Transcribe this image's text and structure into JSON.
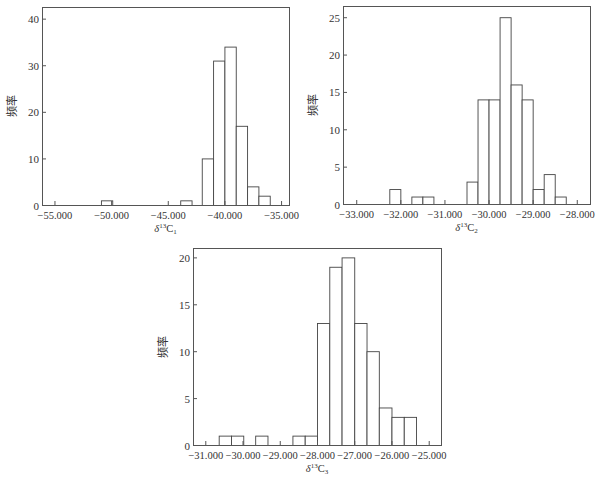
{
  "chart_data": [
    {
      "type": "bar",
      "id": "c1",
      "title": "",
      "xlabel": "δ13C1",
      "xlabel_parts": {
        "delta": "δ",
        "sup": "13",
        "base": "C",
        "sub": "1"
      },
      "ylabel": "频率",
      "xlim": [
        -56100,
        -34300
      ],
      "ylim": [
        0,
        42.5
      ],
      "xticks": [
        -55000,
        -50000,
        -45000,
        -40000,
        -35000
      ],
      "xtick_labels": [
        "-55.000",
        "-50.000",
        "-45.000",
        "-40.000",
        "-35.000"
      ],
      "yticks": [
        0,
        10,
        20,
        30,
        40
      ],
      "ytick_labels": [
        "0",
        "10",
        "20",
        "30",
        "40"
      ],
      "bin_width": 1000,
      "bins": [
        {
          "x0": -50900,
          "x1": -49900,
          "count": 1
        },
        {
          "x0": -43900,
          "x1": -42900,
          "count": 1
        },
        {
          "x0": -42000,
          "x1": -41000,
          "count": 10
        },
        {
          "x0": -41000,
          "x1": -40000,
          "count": 31
        },
        {
          "x0": -40000,
          "x1": -39000,
          "count": 34
        },
        {
          "x0": -39000,
          "x1": -38000,
          "count": 17
        },
        {
          "x0": -38000,
          "x1": -37000,
          "count": 4
        },
        {
          "x0": -37000,
          "x1": -36000,
          "count": 2
        }
      ],
      "grid": false,
      "box": {
        "left": 42,
        "top": 7,
        "right": 289,
        "bottom": 205
      }
    },
    {
      "type": "bar",
      "id": "c2",
      "title": "",
      "xlabel": "δ13C2",
      "xlabel_parts": {
        "delta": "δ",
        "sup": "13",
        "base": "C",
        "sub": "2"
      },
      "ylabel": "频率",
      "xlim": [
        -33300,
        -27700
      ],
      "ylim": [
        0,
        26.5
      ],
      "xticks": [
        -33000,
        -32000,
        -31000,
        -30000,
        -29000,
        -28000
      ],
      "xtick_labels": [
        "-33.000",
        "-32.000",
        "-31.000",
        "-30.000",
        "-29.000",
        "-28.000"
      ],
      "yticks": [
        0,
        5,
        10,
        15,
        20,
        25
      ],
      "ytick_labels": [
        "0",
        "5",
        "10",
        "15",
        "20",
        "25"
      ],
      "bin_width": 250,
      "bins": [
        {
          "x0": -32250,
          "x1": -32000,
          "count": 2
        },
        {
          "x0": -31750,
          "x1": -31500,
          "count": 1
        },
        {
          "x0": -31500,
          "x1": -31250,
          "count": 1
        },
        {
          "x0": -30500,
          "x1": -30250,
          "count": 3
        },
        {
          "x0": -30250,
          "x1": -30000,
          "count": 14
        },
        {
          "x0": -30000,
          "x1": -29750,
          "count": 14
        },
        {
          "x0": -29750,
          "x1": -29500,
          "count": 25
        },
        {
          "x0": -29500,
          "x1": -29250,
          "count": 16
        },
        {
          "x0": -29250,
          "x1": -29000,
          "count": 14
        },
        {
          "x0": -29000,
          "x1": -28750,
          "count": 2
        },
        {
          "x0": -28750,
          "x1": -28500,
          "count": 4
        },
        {
          "x0": -28500,
          "x1": -28250,
          "count": 1
        }
      ],
      "grid": false,
      "box": {
        "left": 343,
        "top": 6,
        "right": 590,
        "bottom": 204
      }
    },
    {
      "type": "bar",
      "id": "c3",
      "title": "",
      "xlabel": "δ13C3",
      "xlabel_parts": {
        "delta": "δ",
        "sup": "13",
        "base": "C",
        "sub": "3"
      },
      "ylabel": "频率",
      "xlim": [
        -31330,
        -24670
      ],
      "ylim": [
        0,
        21
      ],
      "xticks": [
        -31000,
        -30000,
        -29000,
        -28000,
        -27000,
        -26000,
        -25000
      ],
      "xtick_labels": [
        "-31.000",
        "-30.000",
        "-29.000",
        "-28.000",
        "-27.000",
        "-26.000",
        "-25.000"
      ],
      "yticks": [
        0,
        5,
        10,
        15,
        20
      ],
      "ytick_labels": [
        "0",
        "5",
        "10",
        "15",
        "20"
      ],
      "bin_width": 330,
      "bins": [
        {
          "x0": -30640,
          "x1": -30310,
          "count": 1
        },
        {
          "x0": -30310,
          "x1": -29980,
          "count": 1
        },
        {
          "x0": -29660,
          "x1": -29330,
          "count": 1
        },
        {
          "x0": -28660,
          "x1": -28330,
          "count": 1
        },
        {
          "x0": -28330,
          "x1": -28000,
          "count": 1
        },
        {
          "x0": -28000,
          "x1": -27670,
          "count": 13
        },
        {
          "x0": -27670,
          "x1": -27340,
          "count": 19
        },
        {
          "x0": -27340,
          "x1": -27000,
          "count": 20
        },
        {
          "x0": -27000,
          "x1": -26670,
          "count": 13
        },
        {
          "x0": -26670,
          "x1": -26340,
          "count": 10
        },
        {
          "x0": -26340,
          "x1": -26000,
          "count": 4
        },
        {
          "x0": -26000,
          "x1": -25670,
          "count": 3
        },
        {
          "x0": -25670,
          "x1": -25340,
          "count": 3
        }
      ],
      "grid": false,
      "box": {
        "left": 193,
        "top": 248,
        "right": 441,
        "bottom": 445
      }
    }
  ],
  "colors": {
    "axis": "#555555",
    "bar_stroke": "#444444",
    "bar_fill": "#ffffff",
    "text": "#333333"
  }
}
